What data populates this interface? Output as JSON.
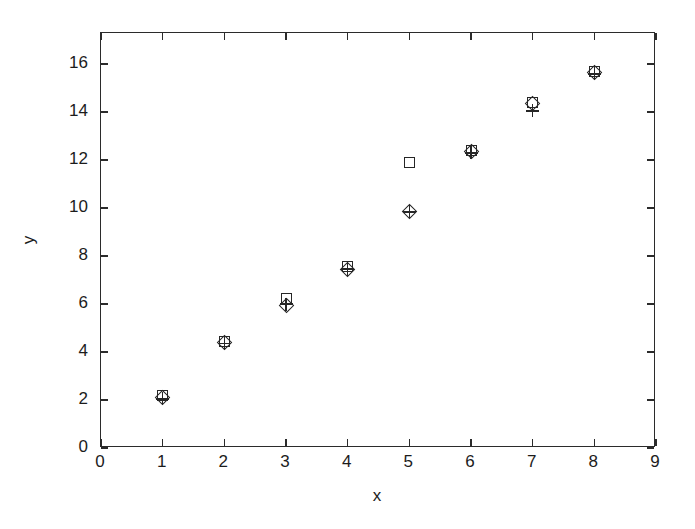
{
  "chart_data": {
    "type": "scatter",
    "title": "",
    "xlabel": "x",
    "ylabel": "y",
    "xlim": [
      0,
      9
    ],
    "ylim": [
      0,
      17.3
    ],
    "grid": false,
    "legend": "none",
    "x_ticks": [
      0,
      1,
      2,
      3,
      4,
      5,
      6,
      7,
      8,
      9
    ],
    "x_tick_labels": [
      "0",
      "1",
      "2",
      "3",
      "4",
      "5",
      "6",
      "7",
      "8",
      "9"
    ],
    "y_ticks": [
      0,
      2,
      4,
      6,
      8,
      10,
      12,
      14,
      16
    ],
    "y_tick_labels": [
      "0",
      "2",
      "4",
      "6",
      "8",
      "10",
      "12",
      "14",
      "16"
    ],
    "x": [
      1,
      2,
      3,
      4,
      5,
      6,
      7,
      8
    ],
    "series": [
      {
        "name": "series-square",
        "marker": "square",
        "values": [
          2.2,
          4.45,
          6.25,
          7.55,
          11.9,
          12.4,
          14.4,
          15.7
        ]
      },
      {
        "name": "series-diamond",
        "marker": "diamond",
        "values": [
          2.1,
          4.4,
          5.95,
          7.45,
          9.85,
          12.35,
          14.35,
          15.65
        ]
      },
      {
        "name": "series-plus",
        "marker": "plus",
        "values": [
          2.05,
          4.35,
          6.0,
          7.45,
          9.85,
          12.3,
          14.05,
          15.6
        ]
      }
    ]
  },
  "figure": {
    "background_color": "#ffffff",
    "axis_color": "#2b2b2b",
    "marker_color": "#262626"
  }
}
